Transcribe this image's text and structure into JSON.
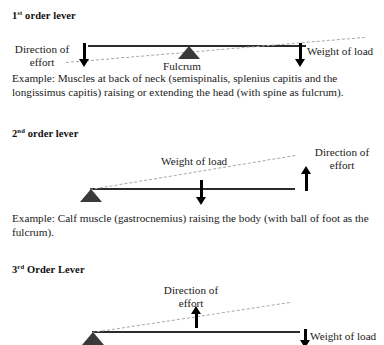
{
  "document": {
    "title": "Classes of Levers"
  },
  "sections": [
    {
      "id": "first-order",
      "heading_number": "1",
      "heading_ordinal": "st",
      "heading_rest": " order lever",
      "heading_full": "1st order lever",
      "labels": {
        "effort": "Direction of\neffort",
        "effort_line1": "Direction of",
        "effort_line2": "effort",
        "fulcrum": "Fulcrum",
        "load": "Weight of load"
      },
      "example": "Example: Muscles at back of neck (semispinalis, splenius capitis and the longissimus capitis) raising or extending the head (with spine as fulcrum)."
    },
    {
      "id": "second-order",
      "heading_number": "2",
      "heading_ordinal": "nd",
      "heading_rest": " order lever",
      "heading_full": "2nd order lever",
      "labels": {
        "effort_line1": "Direction of",
        "effort_line2": "effort",
        "load": "Weight of load"
      },
      "example": "Example: Calf muscle (gastrocnemius) raising the body (with ball of foot as the fulcrum)."
    },
    {
      "id": "third-order",
      "heading_number": "3",
      "heading_ordinal": "rd",
      "heading_rest": " Order Lever",
      "heading_full": "3rd Order Lever",
      "labels": {
        "effort_line1": "Direction of",
        "effort_line2": "effort",
        "load": "Weight of load"
      },
      "example": ""
    }
  ],
  "colors": {
    "bar": "#2b2b2b",
    "fulcrum": "#3a3a3a",
    "dashed": "#a9a9a9",
    "arrow": "#000000",
    "text": "#1a1a1a",
    "background": "#ffffff"
  }
}
